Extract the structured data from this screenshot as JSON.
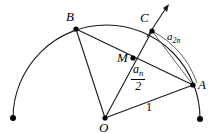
{
  "figure": {
    "type": "geometry-diagram",
    "width": 212,
    "height": 133,
    "stroke_color": "#1a1a1a",
    "background": "#ffffff"
  },
  "labels": {
    "B": "B",
    "C": "C",
    "M": "M",
    "A": "A",
    "O": "O",
    "a_2n_base": "a",
    "a_2n_sub": "2n",
    "a_n_base": "a",
    "a_n_sub": "n",
    "fraction_denominator": "2",
    "radius": "1"
  },
  "points": {
    "B": {
      "x": 76,
      "y": 29
    },
    "C": {
      "x": 152,
      "y": 31
    },
    "M": {
      "x": 133,
      "y": 58
    },
    "A": {
      "x": 193,
      "y": 85
    },
    "O": {
      "x": 105,
      "y": 118
    },
    "arc_end_left": {
      "x": 13,
      "y": 118
    },
    "arc_end_right": {
      "x": 200,
      "y": 119
    },
    "arrow_tip": {
      "x": 169,
      "y": 5
    }
  },
  "segments": [
    {
      "name": "O-B",
      "from": "O",
      "to": "B"
    },
    {
      "name": "O-C",
      "from": "O",
      "to": "C"
    },
    {
      "name": "O-A",
      "from": "O",
      "to": "A"
    },
    {
      "name": "B-A",
      "from": "B",
      "to": "A"
    },
    {
      "name": "C-A",
      "from": "C",
      "to": "A"
    },
    {
      "name": "C-arrow",
      "from": "C",
      "to": "arrow_tip"
    }
  ]
}
